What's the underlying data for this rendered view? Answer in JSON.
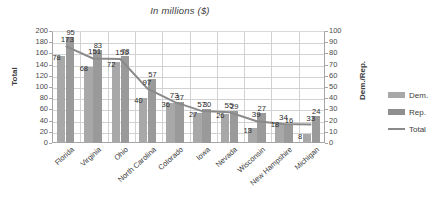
{
  "chart_data": {
    "type": "bar",
    "title": "In millions ($)",
    "xlabel": "",
    "ylabel": "Total",
    "y2label": "Dem./Rep.",
    "ylim": [
      0,
      200
    ],
    "y2lim": [
      0,
      100
    ],
    "yticks": [
      200,
      180,
      160,
      140,
      120,
      100,
      80,
      60,
      40,
      20,
      0
    ],
    "y2ticks": [
      100,
      90,
      80,
      70,
      60,
      50,
      40,
      30,
      20,
      10,
      0
    ],
    "grid": true,
    "legend_position": "right",
    "categories": [
      "Florida",
      "Virginia",
      "Ohio",
      "North Carolina",
      "Colorado",
      "Iowa",
      "Nevada",
      "Wisconsin",
      "New Hampshire",
      "Michigan"
    ],
    "series": [
      {
        "name": "Dem.",
        "kind": "bar",
        "axis": "right",
        "color": "#a8a8a8",
        "values": [
          78,
          68,
          72,
          40,
          36,
          27,
          26,
          13,
          18,
          8
        ]
      },
      {
        "name": "Rep.",
        "kind": "bar",
        "axis": "right",
        "color": "#9a9a9a",
        "values": [
          95,
          83,
          78,
          57,
          37,
          30,
          29,
          27,
          16,
          24
        ]
      },
      {
        "name": "Total",
        "kind": "line",
        "axis": "left",
        "color": "#8a8a8a",
        "values": [
          173,
          151,
          150,
          97,
          73,
          57,
          55,
          39,
          34,
          33
        ]
      }
    ]
  },
  "legend": {
    "items": [
      {
        "label": "Dem."
      },
      {
        "label": "Rep."
      },
      {
        "label": "Total"
      }
    ]
  }
}
